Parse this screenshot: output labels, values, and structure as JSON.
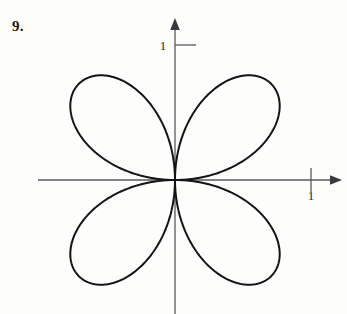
{
  "page": {
    "background_color": "#fdfdfc",
    "ink_color": "#1a1a1c",
    "axis_color": "#5a5a5e"
  },
  "problem": {
    "number_label": "9."
  },
  "top_cut_text": "",
  "axes": {
    "x_axis_label": "1",
    "y_axis_label": "1",
    "x_tick_value": "1",
    "y_tick_value": "1",
    "origin_px": {
      "x": 175,
      "y": 180
    },
    "unit_px": 136,
    "x_axis_start_px": 38,
    "x_axis_end_px": 342,
    "y_axis_top_px": 18,
    "y_axis_bottom_px": 314,
    "x_tick_px": 311,
    "y_tick_px": 45,
    "arrow_x": "right",
    "arrow_y": "up"
  },
  "chart_data": {
    "type": "line",
    "title": "",
    "subtitle": "",
    "xlabel": "",
    "ylabel": "",
    "curve_name": "four-petaled rose",
    "polar_equation": "r = cos(2θ)",
    "orientation": "petals along the diagonals (rotated 45°)",
    "petal_count": 4,
    "max_radius": 1,
    "petal_tip_angles_deg": [
      45,
      135,
      225,
      315
    ],
    "xlim": [
      -1.01,
      1.22
    ],
    "ylim": [
      -1.0,
      1.12
    ],
    "grid": false,
    "legend": false,
    "stroke_color": "#141416",
    "stroke_width": 2.0,
    "fill": "none",
    "theta_range_deg": [
      0,
      360
    ],
    "sample_count": 721
  }
}
